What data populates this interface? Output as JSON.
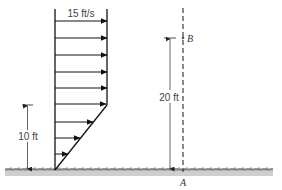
{
  "figure": {
    "velocity_label": "15 ft/s",
    "height_label_left": "10 ft",
    "height_label_right": "20 ft",
    "point_top": "B",
    "point_bottom": "A",
    "arrow_count": 9,
    "colors": {
      "line": "#111111",
      "dashed_line": "#8a8a8a",
      "ground": "#cfcfcf",
      "text": "#444444"
    }
  }
}
